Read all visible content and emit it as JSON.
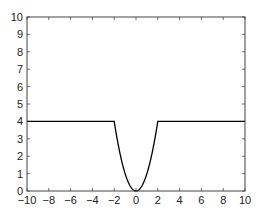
{
  "chart_data": {
    "type": "line",
    "title": "",
    "xlabel": "",
    "ylabel": "",
    "xlim": [
      -10,
      10
    ],
    "ylim": [
      0,
      10
    ],
    "grid": false,
    "legend": null,
    "x_ticks": [
      -10,
      -8,
      -6,
      -4,
      -2,
      0,
      2,
      4,
      6,
      8,
      10
    ],
    "x_tick_labels": [
      "−10",
      "−8",
      "−6",
      "−4",
      "−2",
      "0",
      "2",
      "4",
      "6",
      "8",
      "10"
    ],
    "y_ticks": [
      0,
      1,
      2,
      3,
      4,
      5,
      6,
      7,
      8,
      9,
      10
    ],
    "y_tick_labels": [
      "0",
      "1",
      "2",
      "3",
      "4",
      "5",
      "6",
      "7",
      "8",
      "9",
      "10"
    ],
    "series": [
      {
        "name": "f(x)",
        "description": "f(x) = 4 for |x| >= 2, f(x) = x^2 for |x| < 2",
        "color": "#000000",
        "x": [
          -10,
          -2,
          -1.5,
          -1,
          -0.5,
          0,
          0.5,
          1,
          1.5,
          2,
          10
        ],
        "y": [
          4,
          4,
          2.25,
          1,
          0.25,
          0,
          0.25,
          1,
          2.25,
          4,
          4
        ]
      }
    ]
  }
}
